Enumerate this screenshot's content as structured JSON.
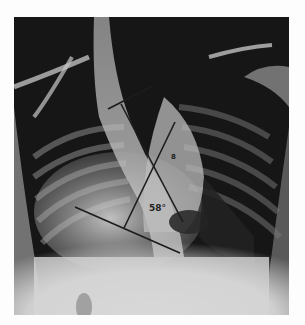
{
  "figure": {
    "labels": {
      "vertebra_marker": "8",
      "cobb_angle": "58°"
    },
    "colors": {
      "background": "#fdfdfd",
      "film_dark": "#1a1a1a",
      "line": "#1c1c1c"
    }
  }
}
